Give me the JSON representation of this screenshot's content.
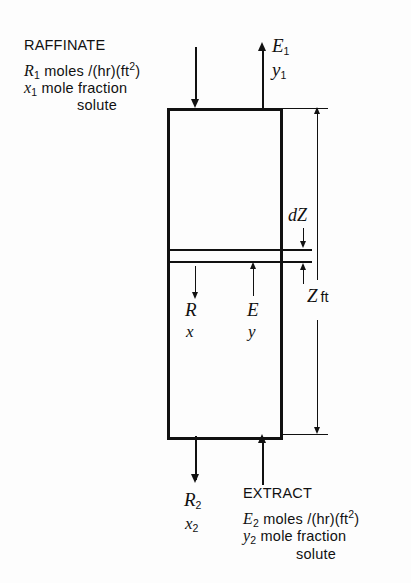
{
  "diagram": {
    "feed_top": {
      "name": "RAFFINATE",
      "flow_symbol": "R",
      "flow_sub": "1",
      "flow_units": " moles /(hr)(ft",
      "flow_units_sup": "2",
      "flow_units_tail": ")",
      "comp_symbol": "x",
      "comp_sub": "1",
      "comp_text": " mole fraction",
      "comp_text2": "solute"
    },
    "product_top": {
      "flow_symbol": "E",
      "flow_sub": "1",
      "comp_symbol": "y",
      "comp_sub": "1"
    },
    "interior": {
      "left_flow": "R",
      "left_comp": "x",
      "right_flow": "E",
      "right_comp": "y"
    },
    "differential": {
      "label_symbol": "d",
      "label_var": "Z"
    },
    "height": {
      "symbol": "Z",
      "units": "ft"
    },
    "product_bottom": {
      "flow_symbol": "R",
      "flow_sub": "2",
      "comp_symbol": "x",
      "comp_sub": "2"
    },
    "feed_bottom": {
      "name": "EXTRACT",
      "flow_symbol": "E",
      "flow_sub": "2",
      "flow_units": " moles /(hr)(ft",
      "flow_units_sup": "2",
      "flow_units_tail": ")",
      "comp_symbol": "y",
      "comp_sub": "2",
      "comp_text": " mole fraction",
      "comp_text2": "solute"
    },
    "colors": {
      "ink": "#111111",
      "background": "#fdfdfd"
    }
  }
}
